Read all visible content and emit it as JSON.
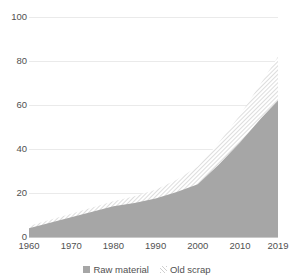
{
  "chart_data": {
    "type": "area",
    "title": "",
    "xlabel": "",
    "ylabel": "",
    "stacked": true,
    "grid": true,
    "legend_position": "bottom",
    "ylim": [
      0,
      100
    ],
    "yticks": [
      "0",
      "20",
      "40",
      "60",
      "80",
      "100"
    ],
    "xticks": [
      "1960",
      "1970",
      "1980",
      "1990",
      "2000",
      "2010",
      "2019"
    ],
    "x": [
      1960,
      1965,
      1970,
      1975,
      1980,
      1985,
      1990,
      1995,
      2000,
      2005,
      2010,
      2015,
      2019
    ],
    "series": [
      {
        "name": "Raw material",
        "color": "#a6a6a6",
        "fill": "solid",
        "values": [
          4.0,
          6.5,
          9.0,
          11.5,
          14.0,
          15.5,
          17.5,
          20.5,
          24.0,
          33.0,
          43.0,
          54.0,
          62.0
        ]
      },
      {
        "name": "Old scrap",
        "color": "#d9d9d9",
        "fill": "diagonal-hatch",
        "values": [
          1.0,
          1.3,
          1.6,
          1.9,
          2.2,
          3.0,
          4.0,
          5.5,
          8.0,
          10.0,
          12.5,
          16.0,
          20.0
        ]
      }
    ],
    "totals": [
      5.0,
      7.8,
      10.6,
      13.4,
      16.2,
      18.5,
      21.5,
      26.0,
      32.0,
      43.0,
      55.5,
      70.0,
      82.0
    ]
  },
  "legend": {
    "items": [
      {
        "label": "Raw material",
        "swatch": "solid-gray-square"
      },
      {
        "label": "Old scrap",
        "swatch": "hatched-square"
      }
    ]
  },
  "colors": {
    "raw_material": "#a6a6a6",
    "old_scrap": "#d9d9d9",
    "gridline": "#eaeaea",
    "axis": "#c9c9c9",
    "text": "#515151"
  }
}
